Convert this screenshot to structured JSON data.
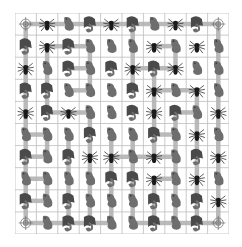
{
  "game": {
    "title": "Creature path puzzle",
    "grid": {
      "rows": 10,
      "cols": 10
    },
    "legend": {
      "S": "spider",
      "D": "dragon",
      "L": "lizard",
      "T": "target"
    },
    "cells": [
      [
        "T",
        "S",
        "L",
        "D",
        "S",
        "D",
        "L",
        "S",
        "D",
        "T"
      ],
      [
        "D",
        "S",
        "D",
        "L",
        "L",
        "L",
        "S",
        "L",
        "S",
        "L"
      ],
      [
        "S",
        "L",
        "D",
        "L",
        "D",
        "S",
        "D",
        "S",
        "L",
        "L"
      ],
      [
        "D",
        "D",
        "L",
        "L",
        "L",
        "D",
        "S",
        "L",
        "S",
        "L"
      ],
      [
        "S",
        "D",
        "S",
        "L",
        "L",
        "D",
        "S",
        "D",
        "L",
        "S"
      ],
      [
        "L",
        "L",
        "L",
        "D",
        "L",
        "L",
        "D",
        "L",
        "S",
        "L"
      ],
      [
        "D",
        "L",
        "D",
        "S",
        "S",
        "L",
        "S",
        "L",
        "D",
        "S"
      ],
      [
        "L",
        "L",
        "L",
        "L",
        "D",
        "D",
        "S",
        "L",
        "S",
        "L"
      ],
      [
        "D",
        "L",
        "D",
        "L",
        "L",
        "L",
        "D",
        "L",
        "D",
        "S"
      ],
      [
        "T",
        "L",
        "D",
        "D",
        "L",
        "L",
        "D",
        "L",
        "D",
        "T"
      ]
    ],
    "paths": [
      [
        [
          0,
          0
        ],
        [
          0,
          4
        ]
      ],
      [
        [
          0,
          0
        ],
        [
          9,
          0
        ]
      ],
      [
        [
          0,
          4
        ],
        [
          0,
          9
        ]
      ],
      [
        [
          0,
          5
        ],
        [
          3,
          5
        ]
      ],
      [
        [
          0,
          9
        ],
        [
          9,
          9
        ]
      ],
      [
        [
          1,
          1
        ],
        [
          1,
          3
        ]
      ],
      [
        [
          1,
          1
        ],
        [
          4,
          1
        ]
      ],
      [
        [
          1,
          3
        ],
        [
          3,
          3
        ]
      ],
      [
        [
          2,
          2
        ],
        [
          2,
          3
        ]
      ],
      [
        [
          3,
          2
        ],
        [
          3,
          3
        ]
      ],
      [
        [
          1,
          6
        ],
        [
          1,
          7
        ]
      ],
      [
        [
          1,
          7
        ],
        [
          2,
          7
        ]
      ],
      [
        [
          2,
          5
        ],
        [
          2,
          7
        ]
      ],
      [
        [
          2,
          6
        ],
        [
          6,
          6
        ]
      ],
      [
        [
          3,
          6
        ],
        [
          3,
          8
        ]
      ],
      [
        [
          3,
          8
        ],
        [
          9,
          8
        ]
      ],
      [
        [
          4,
          1
        ],
        [
          4,
          3
        ]
      ],
      [
        [
          4,
          3
        ],
        [
          9,
          3
        ]
      ],
      [
        [
          4,
          7
        ],
        [
          4,
          8
        ]
      ],
      [
        [
          4,
          7
        ],
        [
          9,
          7
        ]
      ],
      [
        [
          5,
          0
        ],
        [
          5,
          1
        ]
      ],
      [
        [
          5,
          1
        ],
        [
          6,
          1
        ]
      ],
      [
        [
          6,
          0
        ],
        [
          6,
          1
        ]
      ],
      [
        [
          5,
          2
        ],
        [
          9,
          2
        ]
      ],
      [
        [
          5,
          4
        ],
        [
          9,
          4
        ]
      ],
      [
        [
          5,
          5
        ],
        [
          9,
          5
        ]
      ],
      [
        [
          5,
          6
        ],
        [
          5,
          7
        ]
      ],
      [
        [
          6,
          4
        ],
        [
          6,
          7
        ]
      ],
      [
        [
          7,
          0
        ],
        [
          7,
          1
        ]
      ],
      [
        [
          7,
          1
        ],
        [
          8,
          1
        ]
      ],
      [
        [
          8,
          0
        ],
        [
          8,
          1
        ]
      ],
      [
        [
          7,
          6
        ],
        [
          7,
          7
        ]
      ],
      [
        [
          7,
          6
        ],
        [
          9,
          6
        ]
      ],
      [
        [
          9,
          0
        ],
        [
          9,
          4
        ]
      ],
      [
        [
          9,
          5
        ],
        [
          9,
          9
        ]
      ]
    ],
    "colors": {
      "grid_line": "#bdbdbd",
      "path": "#b3b3b3",
      "creature": "#6e6e6e",
      "creature_dark": "#4a4a4a",
      "spider_body": "#1a1a1a"
    }
  }
}
